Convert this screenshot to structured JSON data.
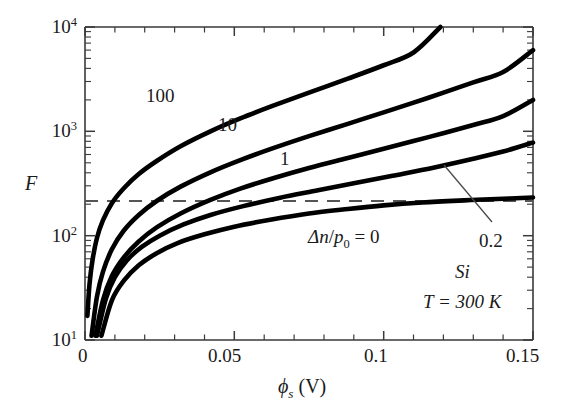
{
  "chart_data": {
    "type": "line",
    "title": "",
    "xlabel": "ϕs (V)",
    "ylabel": "F",
    "xlim": [
      0,
      0.15
    ],
    "ylim": [
      10,
      10000
    ],
    "yscale": "log",
    "grid": false,
    "legend_position": "inline-curve-labels",
    "x_ticks": [
      "0",
      "0.05",
      "0.1",
      "0.15"
    ],
    "x_tick_values": [
      0,
      0.05,
      0.1,
      0.15
    ],
    "x_minor_step": 0.01,
    "y_ticks": [
      "10^1",
      "10^2",
      "10^3",
      "10^4"
    ],
    "y_tick_values": [
      10,
      100,
      1000,
      10000
    ],
    "reference_line": {
      "kind": "horizontal-dashed",
      "value": 230,
      "label": ""
    },
    "series": [
      {
        "name": "100",
        "label": "100",
        "points": [
          [
            0.0008,
            17
          ],
          [
            0.0015,
            34
          ],
          [
            0.0025,
            58
          ],
          [
            0.004,
            95
          ],
          [
            0.006,
            140
          ],
          [
            0.009,
            205
          ],
          [
            0.013,
            285
          ],
          [
            0.018,
            390
          ],
          [
            0.024,
            520
          ],
          [
            0.032,
            720
          ],
          [
            0.042,
            1000
          ],
          [
            0.052,
            1330
          ],
          [
            0.063,
            1760
          ],
          [
            0.075,
            2350
          ],
          [
            0.088,
            3200
          ],
          [
            0.1,
            4300
          ],
          [
            0.11,
            5700
          ],
          [
            0.119,
            10000
          ]
        ]
      },
      {
        "name": "10",
        "label": "10",
        "points": [
          [
            0.0022,
            11
          ],
          [
            0.004,
            26
          ],
          [
            0.006,
            45
          ],
          [
            0.009,
            74
          ],
          [
            0.013,
            112
          ],
          [
            0.018,
            158
          ],
          [
            0.024,
            215
          ],
          [
            0.032,
            295
          ],
          [
            0.042,
            405
          ],
          [
            0.052,
            530
          ],
          [
            0.063,
            690
          ],
          [
            0.075,
            900
          ],
          [
            0.088,
            1180
          ],
          [
            0.1,
            1520
          ],
          [
            0.115,
            2100
          ],
          [
            0.13,
            2950
          ],
          [
            0.14,
            3700
          ],
          [
            0.15,
            6000
          ]
        ]
      },
      {
        "name": "1",
        "label": "1",
        "points": [
          [
            0.0035,
            11
          ],
          [
            0.006,
            24
          ],
          [
            0.009,
            41
          ],
          [
            0.013,
            62
          ],
          [
            0.018,
            88
          ],
          [
            0.024,
            120
          ],
          [
            0.032,
            163
          ],
          [
            0.042,
            220
          ],
          [
            0.052,
            282
          ],
          [
            0.063,
            355
          ],
          [
            0.075,
            445
          ],
          [
            0.088,
            555
          ],
          [
            0.1,
            680
          ],
          [
            0.115,
            880
          ],
          [
            0.13,
            1150
          ],
          [
            0.14,
            1400
          ],
          [
            0.15,
            2000
          ]
        ]
      },
      {
        "name": "0.2",
        "label": "0.2",
        "points": [
          [
            0.004,
            11
          ],
          [
            0.007,
            25
          ],
          [
            0.01,
            40
          ],
          [
            0.014,
            58
          ],
          [
            0.019,
            78
          ],
          [
            0.025,
            100
          ],
          [
            0.033,
            128
          ],
          [
            0.042,
            158
          ],
          [
            0.053,
            192
          ],
          [
            0.065,
            230
          ],
          [
            0.078,
            272
          ],
          [
            0.09,
            318
          ],
          [
            0.103,
            375
          ],
          [
            0.117,
            450
          ],
          [
            0.13,
            545
          ],
          [
            0.14,
            640
          ],
          [
            0.15,
            780
          ]
        ]
      },
      {
        "name": "0",
        "label": "Δn/p0 = 0",
        "points": [
          [
            0.0055,
            11
          ],
          [
            0.009,
            24
          ],
          [
            0.013,
            37
          ],
          [
            0.018,
            52
          ],
          [
            0.024,
            68
          ],
          [
            0.031,
            85
          ],
          [
            0.04,
            103
          ],
          [
            0.05,
            122
          ],
          [
            0.062,
            142
          ],
          [
            0.075,
            163
          ],
          [
            0.088,
            180
          ],
          [
            0.1,
            195
          ],
          [
            0.113,
            208
          ],
          [
            0.127,
            218
          ],
          [
            0.14,
            226
          ],
          [
            0.15,
            232
          ]
        ]
      }
    ],
    "annotations": [
      {
        "text": "Δn/p0 = 0",
        "x": 0.073,
        "y_px": 237
      },
      {
        "text": "0.2",
        "x": 0.1245,
        "y_px": 242
      },
      {
        "text": "Si",
        "x": 0.1125,
        "y_px": 272
      },
      {
        "text": "T = 300 K",
        "x": 0.1005,
        "y_px": 302
      }
    ],
    "leader_line": {
      "from": [
        0.099,
        165
      ],
      "to": [
        0.1195,
        222
      ]
    }
  },
  "labels": {
    "y_axis_title": "F",
    "x_axis_title_symbol": "ϕ",
    "x_axis_title_sub": "s",
    "x_axis_title_unit": "(V)",
    "y_tick_1": "10",
    "y_tick_1_exp": "1",
    "y_tick_2": "10",
    "y_tick_2_exp": "2",
    "y_tick_3": "10",
    "y_tick_3_exp": "3",
    "y_tick_4": "10",
    "y_tick_4_exp": "4",
    "x_tick_1": "0",
    "x_tick_2": "0.05",
    "x_tick_3": "0.1",
    "x_tick_4": "0.15",
    "curve_100": "100",
    "curve_10": "10",
    "curve_1": "1",
    "curve_02": "0.2",
    "annot_dn_delta": "Δ",
    "annot_dn_n": "n",
    "annot_dn_slash": "/",
    "annot_dn_p": "p",
    "annot_dn_sub": "0",
    "annot_dn_eq": " = 0",
    "annot_si": "Si",
    "annot_temp": "T = 300 K"
  },
  "colors": {
    "axis": "#3a3a3a",
    "curve": "#000000",
    "dashed": "#555555",
    "leader": "#4a4a4a",
    "background": "#ffffff"
  }
}
